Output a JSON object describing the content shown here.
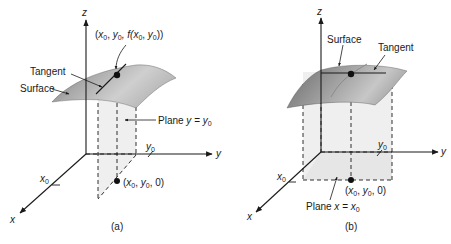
{
  "figure": {
    "panels": [
      {
        "id": "a",
        "caption": "(a)",
        "axes": {
          "x": "x",
          "y": "y",
          "z": "z"
        },
        "labels": {
          "point_top": "(x0, y0, f(x0, y0))",
          "point_top_parts": {
            "open": "(",
            "x": "x",
            "sub0": "0",
            "comma1": ", ",
            "y": "y",
            "comma2": ", f(",
            "x2": "x",
            "comma3": ", ",
            "y2": "y",
            "close": "))"
          },
          "tangent": "Tangent",
          "surface": "Surface",
          "plane": "Plane y = y0",
          "plane_parts": {
            "prefix": "Plane ",
            "var": "y",
            "eq": " = ",
            "val": "y",
            "sub": "0"
          },
          "tick_y": "y0",
          "tick_x": "x0",
          "point_bottom": "(x0, y0, 0)"
        }
      },
      {
        "id": "b",
        "caption": "(b)",
        "axes": {
          "x": "x",
          "y": "y",
          "z": "z"
        },
        "labels": {
          "surface": "Surface",
          "tangent": "Tangent",
          "plane": "Plane x = x0",
          "plane_parts": {
            "prefix": "Plane ",
            "var": "x",
            "eq": " = ",
            "val": "x",
            "sub": "0"
          },
          "tick_y": "y0",
          "tick_x": "x0",
          "point_bottom": "(x0, y0, 0)"
        }
      }
    ],
    "colors": {
      "ink": "#1a1a1a",
      "surface_light": "#d8d8d8",
      "surface_dark": "#7a7a7a",
      "plane_fill": "#efefef"
    }
  }
}
